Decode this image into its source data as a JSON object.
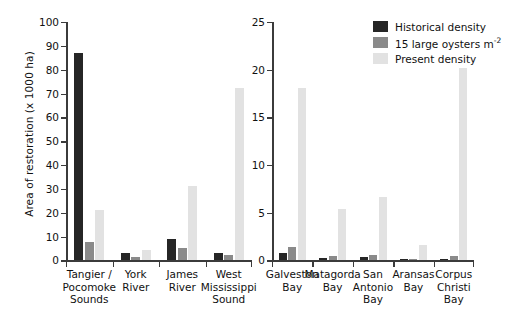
{
  "chart_data": {
    "type": "bar",
    "title": "",
    "xlabel": "",
    "ylabel": "Area of restoration (x 1000 ha)",
    "grid": false,
    "legend_position": "top-right",
    "legend": [
      "Historical density",
      "15 large oysters m-2",
      "Present density"
    ],
    "panels": [
      {
        "name": "left",
        "ylim": [
          0,
          100
        ],
        "yticks": [
          0,
          10,
          20,
          30,
          40,
          50,
          60,
          70,
          80,
          90,
          100
        ],
        "categories": [
          "Tangier /\nPocomoke\nSounds",
          "York\nRiver",
          "James\nRiver",
          "West\nMississippi\nSound"
        ],
        "series": [
          {
            "name": "Historical density",
            "values": [
              87.0,
              3.0,
              9.0,
              3.0
            ]
          },
          {
            "name": "15 large oysters m-2",
            "values": [
              7.8,
              1.4,
              5.2,
              2.2
            ]
          },
          {
            "name": "Present density",
            "values": [
              21.0,
              4.2,
              31.3,
              72.5
            ]
          }
        ]
      },
      {
        "name": "right",
        "ylim": [
          0,
          25
        ],
        "yticks": [
          0,
          5,
          10,
          15,
          20,
          25
        ],
        "categories": [
          "Galveston\nBay",
          "Matagorda\nBay",
          "San\nAntonio\nBay",
          "Aransas\nBay",
          "Corpus\nChristi\nBay"
        ],
        "series": [
          {
            "name": "Historical density",
            "values": [
              0.8,
              0.3,
              0.35,
              0.15,
              0.2
            ]
          },
          {
            "name": "15 large oysters m-2",
            "values": [
              1.4,
              0.5,
              0.6,
              0.2,
              0.5
            ]
          },
          {
            "name": "Present density",
            "values": [
              18.1,
              5.4,
              6.6,
              1.6,
              20.2
            ]
          }
        ]
      }
    ],
    "colors": {
      "historical": "#262626",
      "fifteen_large_oysters": "#8a8a8a",
      "present": "#e2e2e2",
      "axis": "#3b3b3b",
      "text": "#111111"
    }
  },
  "legend": {
    "items": [
      {
        "label": "Historical density",
        "sup": ""
      },
      {
        "label": "15 large oysters m",
        "sup": "-2"
      },
      {
        "label": "Present density",
        "sup": ""
      }
    ]
  },
  "axis": {
    "ylabel": "Area of restoration (x 1000 ha)"
  }
}
